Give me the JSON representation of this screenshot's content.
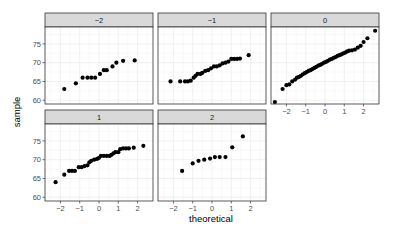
{
  "chart_data": {
    "type": "scatter",
    "subtype": "faceted-qq-plot",
    "title": "",
    "xlabel": "theoretical",
    "ylabel": "sample",
    "xlim": [
      -2.8,
      2.8
    ],
    "ylim": [
      59,
      79.5
    ],
    "x_ticks": [
      -2,
      -1,
      0,
      1,
      2
    ],
    "x_tick_labels": [
      "−2",
      "−1",
      "0",
      "1",
      "2"
    ],
    "y_ticks": [
      60,
      65,
      70,
      75
    ],
    "y_tick_labels": [
      "60",
      "65",
      "70",
      "75"
    ],
    "grid": true,
    "legend": "none",
    "facet_layout": {
      "rows": 2,
      "cols": 3
    },
    "panels": [
      {
        "label": "−2",
        "points": [
          [
            -1.8,
            63
          ],
          [
            -1.2,
            64.5
          ],
          [
            -0.85,
            66
          ],
          [
            -0.6,
            66
          ],
          [
            -0.4,
            66
          ],
          [
            -0.2,
            66
          ],
          [
            0.05,
            67
          ],
          [
            0.25,
            68
          ],
          [
            0.4,
            68
          ],
          [
            0.7,
            69
          ],
          [
            0.9,
            70
          ],
          [
            1.25,
            70.5
          ],
          [
            1.85,
            70.6
          ]
        ]
      },
      {
        "label": "−1",
        "points": [
          [
            -2.15,
            65
          ],
          [
            -1.65,
            65
          ],
          [
            -1.4,
            65
          ],
          [
            -1.25,
            65
          ],
          [
            -1.1,
            65.2
          ],
          [
            -0.95,
            66
          ],
          [
            -0.85,
            66.5
          ],
          [
            -0.75,
            67
          ],
          [
            -0.6,
            67
          ],
          [
            -0.5,
            67.3
          ],
          [
            -0.35,
            67.8
          ],
          [
            -0.2,
            68
          ],
          [
            -0.05,
            68.5
          ],
          [
            0.1,
            69
          ],
          [
            0.25,
            69
          ],
          [
            0.4,
            69.3
          ],
          [
            0.55,
            69.8
          ],
          [
            0.7,
            70
          ],
          [
            0.85,
            70.3
          ],
          [
            1.0,
            71
          ],
          [
            1.15,
            71
          ],
          [
            1.3,
            71
          ],
          [
            1.45,
            71.1
          ],
          [
            1.9,
            72
          ]
        ]
      },
      {
        "label": "0",
        "points": [
          [
            -2.6,
            59.5
          ],
          [
            -2.2,
            63
          ],
          [
            -2.0,
            64
          ],
          [
            -1.85,
            64.2
          ],
          [
            -1.7,
            65
          ],
          [
            -1.55,
            65.5
          ],
          [
            -1.45,
            66
          ],
          [
            -1.35,
            66.2
          ],
          [
            -1.25,
            66.5
          ],
          [
            -1.15,
            66.9
          ],
          [
            -1.05,
            67.2
          ],
          [
            -0.95,
            67.5
          ],
          [
            -0.85,
            67.8
          ],
          [
            -0.75,
            68
          ],
          [
            -0.65,
            68.3
          ],
          [
            -0.55,
            68.6
          ],
          [
            -0.45,
            68.9
          ],
          [
            -0.35,
            69.2
          ],
          [
            -0.25,
            69.4
          ],
          [
            -0.15,
            69.7
          ],
          [
            -0.05,
            70
          ],
          [
            0.05,
            70.2
          ],
          [
            0.15,
            70.5
          ],
          [
            0.25,
            70.8
          ],
          [
            0.35,
            71
          ],
          [
            0.45,
            71.3
          ],
          [
            0.55,
            71.5
          ],
          [
            0.65,
            71.8
          ],
          [
            0.75,
            72
          ],
          [
            0.85,
            72.2
          ],
          [
            0.95,
            72.5
          ],
          [
            1.05,
            72.7
          ],
          [
            1.15,
            73
          ],
          [
            1.25,
            73.2
          ],
          [
            1.4,
            73.3
          ],
          [
            1.55,
            73.5
          ],
          [
            1.7,
            74
          ],
          [
            1.85,
            74.5
          ],
          [
            2.0,
            75.5
          ],
          [
            2.2,
            76.5
          ],
          [
            2.6,
            78.5
          ]
        ]
      },
      {
        "label": "1",
        "points": [
          [
            -2.25,
            64
          ],
          [
            -1.8,
            66
          ],
          [
            -1.55,
            67
          ],
          [
            -1.4,
            67
          ],
          [
            -1.25,
            67
          ],
          [
            -1.05,
            68
          ],
          [
            -0.9,
            68
          ],
          [
            -0.75,
            68.3
          ],
          [
            -0.6,
            68.5
          ],
          [
            -0.5,
            69.3
          ],
          [
            -0.4,
            69.7
          ],
          [
            -0.25,
            70
          ],
          [
            -0.1,
            70.2
          ],
          [
            0.0,
            70.5
          ],
          [
            0.1,
            71
          ],
          [
            0.25,
            71
          ],
          [
            0.4,
            71
          ],
          [
            0.55,
            71
          ],
          [
            0.65,
            71.3
          ],
          [
            0.75,
            71.7
          ],
          [
            0.85,
            72
          ],
          [
            1.0,
            72
          ],
          [
            1.1,
            72.8
          ],
          [
            1.25,
            73
          ],
          [
            1.4,
            73
          ],
          [
            1.55,
            73
          ],
          [
            1.8,
            73.2
          ],
          [
            2.3,
            73.7
          ]
        ]
      },
      {
        "label": "2",
        "points": [
          [
            -1.55,
            67
          ],
          [
            -1.0,
            69
          ],
          [
            -0.7,
            69.7
          ],
          [
            -0.4,
            70
          ],
          [
            -0.1,
            70.3
          ],
          [
            0.15,
            70.7
          ],
          [
            0.4,
            70.7
          ],
          [
            0.7,
            70.7
          ],
          [
            1.05,
            73.3
          ],
          [
            1.6,
            76.2
          ]
        ]
      }
    ]
  },
  "colors": {
    "point": "#000000",
    "strip_fill": "#d9d9d9",
    "panel_border": "#333333",
    "grid": "#ebebeb",
    "tick_text": "#4d4d4d"
  }
}
